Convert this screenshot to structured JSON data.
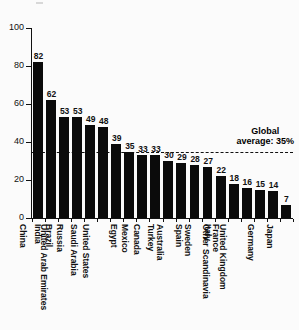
{
  "chart_data": {
    "type": "bar",
    "title": "",
    "xlabel": "",
    "ylabel": "",
    "ylim": [
      0,
      100
    ],
    "yticks": [
      0,
      20,
      40,
      60,
      80,
      100
    ],
    "grid": false,
    "legend": "none",
    "orientation": "vertical",
    "bar_color": "#0b0b0b",
    "categories": [
      "China",
      "India",
      "Brazil",
      "Russia",
      "United Arab Emirates",
      "Saudi Arabia",
      "United States",
      "Egypt",
      "Mexico",
      "Canada",
      "Turkey",
      "Australia",
      "Spain",
      "Sweden",
      "Italy",
      "France",
      "Other Scandinavia",
      "United Kingdom",
      "Germany",
      "Japan"
    ],
    "values": [
      82,
      62,
      53,
      53,
      49,
      48,
      39,
      35,
      33,
      33,
      30,
      29,
      28,
      27,
      22,
      18,
      16,
      15,
      14,
      7
    ],
    "annotations": [
      {
        "name": "global-average",
        "value": 35,
        "line_style": "dashed",
        "label_line_1": "Global",
        "label_line_2": "average: 35%"
      }
    ]
  },
  "axis": {
    "y_tick_labels": [
      "0",
      "20",
      "40",
      "60",
      "80",
      "100"
    ]
  }
}
